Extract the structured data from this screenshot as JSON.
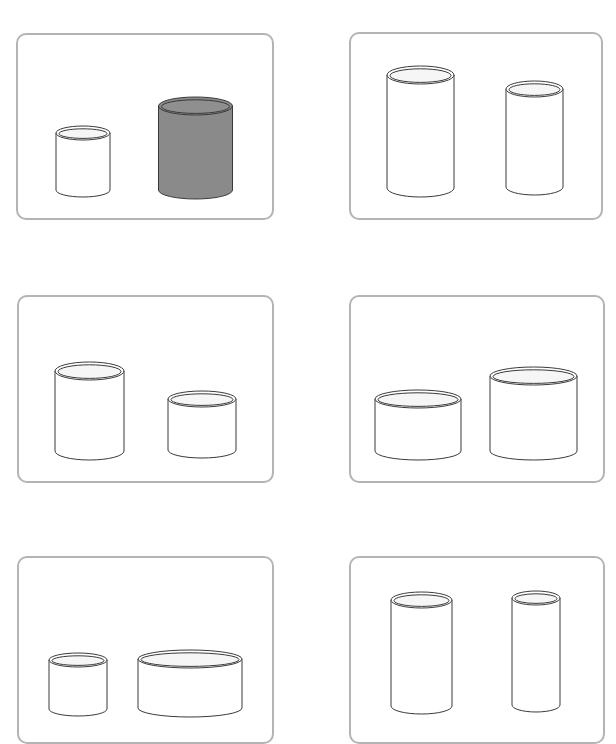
{
  "colors": {
    "background": "#ffffff",
    "panel_border": "#b4b4b4",
    "cylinder_stroke": "#3a3a3a",
    "cylinder_fill_light": "#ffffff",
    "cylinder_fill_dark": "#8a8a8a",
    "rim_inner_light": "#f6f6f6",
    "rim_inner_dark": "#8f8f8f"
  },
  "panels": [
    {
      "id": "panel-1",
      "box": {
        "x": 16,
        "y": 33,
        "w": 258,
        "h": 187
      },
      "cylinders": [
        {
          "id": "small",
          "cx": 83,
          "rx": 27,
          "ry": 7,
          "top": 133,
          "bottom": 190,
          "shaded": false
        },
        {
          "id": "large-shaded",
          "cx": 195.5,
          "rx": 37,
          "ry": 9,
          "top": 106,
          "bottom": 190,
          "shaded": true
        }
      ]
    },
    {
      "id": "panel-2",
      "box": {
        "x": 349,
        "y": 32,
        "w": 254,
        "h": 188
      },
      "cylinders": [
        {
          "id": "tall-wide",
          "cx": 420.5,
          "rx": 33.5,
          "ry": 9,
          "top": 75,
          "bottom": 188,
          "shaded": false
        },
        {
          "id": "tall-narrow",
          "cx": 534.5,
          "rx": 28.5,
          "ry": 8,
          "top": 89,
          "bottom": 187,
          "shaded": false
        }
      ]
    },
    {
      "id": "panel-3",
      "box": {
        "x": 17,
        "y": 295,
        "w": 257,
        "h": 188
      },
      "cylinders": [
        {
          "id": "medium-tall",
          "cx": 89.5,
          "rx": 34.5,
          "ry": 9,
          "top": 371,
          "bottom": 451,
          "shaded": false
        },
        {
          "id": "medium-short",
          "cx": 202,
          "rx": 34,
          "ry": 8,
          "top": 399,
          "bottom": 450,
          "shaded": false
        }
      ]
    },
    {
      "id": "panel-4",
      "box": {
        "x": 349,
        "y": 295,
        "w": 256,
        "h": 188
      },
      "cylinders": [
        {
          "id": "wide-short",
          "cx": 418,
          "rx": 43,
          "ry": 9,
          "top": 399,
          "bottom": 451,
          "shaded": false
        },
        {
          "id": "wide-taller",
          "cx": 533.5,
          "rx": 43.5,
          "ry": 9,
          "top": 376,
          "bottom": 451,
          "shaded": false
        }
      ]
    },
    {
      "id": "panel-5",
      "box": {
        "x": 17,
        "y": 556,
        "w": 257,
        "h": 188
      },
      "cylinders": [
        {
          "id": "small-short",
          "cx": 78,
          "rx": 29,
          "ry": 7,
          "top": 660,
          "bottom": 709,
          "shaded": false
        },
        {
          "id": "very-wide-short",
          "cx": 190,
          "rx": 52,
          "ry": 9,
          "top": 659,
          "bottom": 708,
          "shaded": false
        }
      ]
    },
    {
      "id": "panel-6",
      "box": {
        "x": 349,
        "y": 556,
        "w": 256,
        "h": 188
      },
      "cylinders": [
        {
          "id": "tall-medium",
          "cx": 421.5,
          "rx": 30.5,
          "ry": 8,
          "top": 600,
          "bottom": 706,
          "shaded": false
        },
        {
          "id": "tall-thin",
          "cx": 536,
          "rx": 24,
          "ry": 7,
          "top": 598,
          "bottom": 705,
          "shaded": false
        }
      ]
    }
  ]
}
